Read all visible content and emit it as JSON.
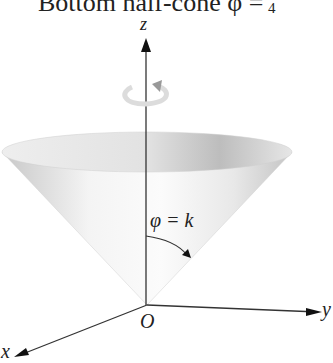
{
  "title": {
    "text": "Bottom half-cone φ =",
    "fraction_denominator": "4"
  },
  "axes": {
    "z_label": "z",
    "y_label": "y",
    "x_label": "x",
    "origin_label": "O"
  },
  "annotation": {
    "angle_label": "φ = k"
  },
  "icons": {
    "rotation": "rotation-arrow-icon"
  }
}
